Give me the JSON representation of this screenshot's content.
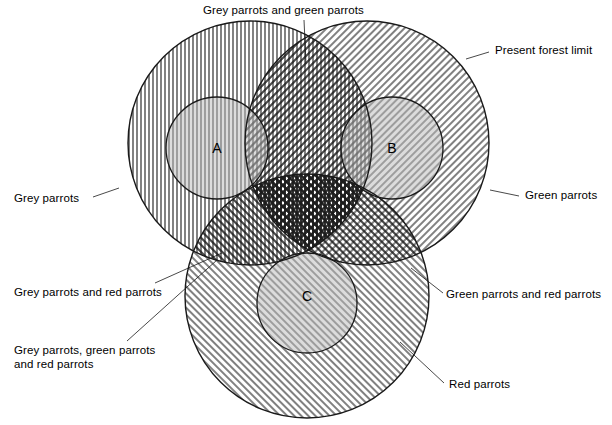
{
  "diagram": {
    "type": "venn-3-set",
    "title_region": "parrot distribution venn diagram",
    "inner_circles": [
      {
        "id": "A",
        "label": "A",
        "cx": 217,
        "cy": 148,
        "r": 51
      },
      {
        "id": "B",
        "label": "B",
        "cx": 392,
        "cy": 148,
        "r": 51
      },
      {
        "id": "C",
        "label": "C",
        "cx": 307,
        "cy": 303,
        "r": 50
      }
    ],
    "sets": [
      {
        "id": "grey",
        "name": "Grey parrots",
        "hatch": "vertical",
        "cx": 250,
        "cy": 143,
        "r": 122
      },
      {
        "id": "green",
        "name": "Green parrots",
        "hatch": "diagonal-right",
        "cx": 367,
        "cy": 143,
        "r": 122
      },
      {
        "id": "red",
        "name": "Red parrots",
        "hatch": "diagonal-left",
        "cx": 307,
        "cy": 296,
        "r": 122
      }
    ],
    "stroke_color": "#1a1a1a",
    "fill_color": "#ffffff"
  },
  "labels": {
    "grey_and_green": "Grey parrots and green parrots",
    "present_forest_limit": "Present forest limit",
    "grey_parrots": "Grey parrots",
    "green_parrots": "Green parrots",
    "grey_and_red": "Grey parrots and red parrots",
    "green_and_red": "Green parrots and red parrots",
    "grey_green_and_red_line1": "Grey parrots, green parrots",
    "grey_green_and_red_line2": "and red parrots",
    "red_parrots": "Red parrots",
    "letter_a": "A",
    "letter_b": "B",
    "letter_c": "C"
  }
}
